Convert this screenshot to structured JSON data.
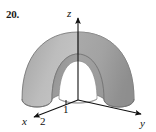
{
  "figure": {
    "problem_number": "20.",
    "caption_number": "20",
    "background_color": "#ffffff"
  },
  "axes": {
    "x": {
      "label": "x",
      "direction": "front-left",
      "arrowhead": true
    },
    "y": {
      "label": "y",
      "direction": "front-right",
      "arrowhead": true
    },
    "z": {
      "label": "z",
      "direction": "up",
      "arrowhead": true
    },
    "line_color": "#111111",
    "origin_label": ""
  },
  "ticks": [
    {
      "id": "tick-1",
      "label": "1",
      "axis": "z-base",
      "note": "inner radius mark near origin"
    },
    {
      "id": "tick-2",
      "label": "2",
      "axis": "x",
      "note": "outer radius mark on x axis"
    }
  ],
  "solid": {
    "name": "hemispherical-shell",
    "inner_radius": "1",
    "outer_radius": "2",
    "cut": "quarter removed",
    "outer_surface_color": "#b9b9b9",
    "outer_surface_shade_light": "#c8c8c8",
    "outer_surface_shade_dark": "#9d9d9d",
    "cut_face_color": "#8e8e8e",
    "inner_surface_color": "#a5a5a5",
    "cavity_color": "#ffffff",
    "edge_color": "#6f6f6f"
  }
}
